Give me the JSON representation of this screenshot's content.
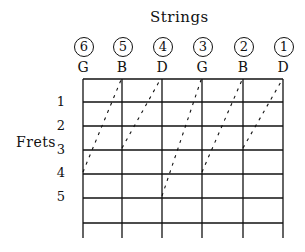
{
  "title": "Strings",
  "axis_label": "Frets",
  "strings": [
    {
      "number": "6",
      "note": "G",
      "x": 83
    },
    {
      "number": "5",
      "note": "B",
      "x": 122
    },
    {
      "number": "4",
      "note": "D",
      "x": 162
    },
    {
      "number": "3",
      "note": "G",
      "x": 202
    },
    {
      "number": "2",
      "note": "B",
      "x": 243
    },
    {
      "number": "1",
      "note": "D",
      "x": 283
    }
  ],
  "frets": [
    {
      "label": "1",
      "y": 102
    },
    {
      "label": "2",
      "y": 126
    },
    {
      "label": "3",
      "y": 150
    },
    {
      "label": "4",
      "y": 174
    },
    {
      "label": "5",
      "y": 198
    }
  ]
}
